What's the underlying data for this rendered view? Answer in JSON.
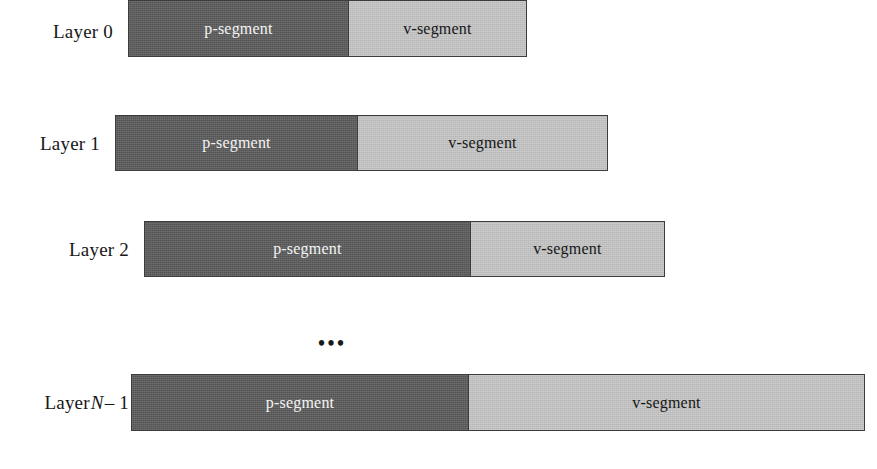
{
  "figure": {
    "type": "diagram",
    "background_color": "#ffffff",
    "p_segment_color": "#5a5a5a",
    "v_segment_color": "#c6c6c6",
    "border_color": "#3d3d3d",
    "p_label_text_color": "#f4f4f4",
    "v_label_text_color": "#161616"
  },
  "ellipsis": {
    "text": "•••"
  },
  "layers": [
    {
      "id": "layer-0",
      "label_prefix": "Layer",
      "label_index": "0",
      "label_italic": "",
      "label_suffix": "",
      "label_full": "Layer 0",
      "bar": {
        "x": 128,
        "y": 0,
        "width": 399,
        "height": 57
      },
      "segments": [
        {
          "name": "p-segment",
          "label": "p-segment",
          "width": 220
        },
        {
          "name": "v-segment",
          "label": "v-segment",
          "width": 179
        }
      ]
    },
    {
      "id": "layer-1",
      "label_prefix": "Layer",
      "label_index": "1",
      "label_italic": "",
      "label_suffix": "",
      "label_full": "Layer 1",
      "bar": {
        "x": 115,
        "y": 115,
        "width": 493,
        "height": 56
      },
      "segments": [
        {
          "name": "p-segment",
          "label": "p-segment",
          "width": 242
        },
        {
          "name": "v-segment",
          "label": "v-segment",
          "width": 251
        }
      ]
    },
    {
      "id": "layer-2",
      "label_prefix": "Layer",
      "label_index": "2",
      "label_italic": "",
      "label_suffix": "",
      "label_full": "Layer 2",
      "bar": {
        "x": 144,
        "y": 221,
        "width": 521,
        "height": 56
      },
      "segments": [
        {
          "name": "p-segment",
          "label": "p-segment",
          "width": 326
        },
        {
          "name": "v-segment",
          "label": "v-segment",
          "width": 195
        }
      ]
    },
    {
      "id": "layer-n-minus-1",
      "label_prefix": "Layer",
      "label_index": "",
      "label_italic": "N",
      "label_suffix": "– 1",
      "label_full": "Layer N – 1",
      "bar": {
        "x": 131,
        "y": 374,
        "width": 734,
        "height": 57
      },
      "segments": [
        {
          "name": "p-segment",
          "label": "p-segment",
          "width": 337
        },
        {
          "name": "v-segment",
          "label": "v-segment",
          "width": 397
        }
      ]
    }
  ]
}
